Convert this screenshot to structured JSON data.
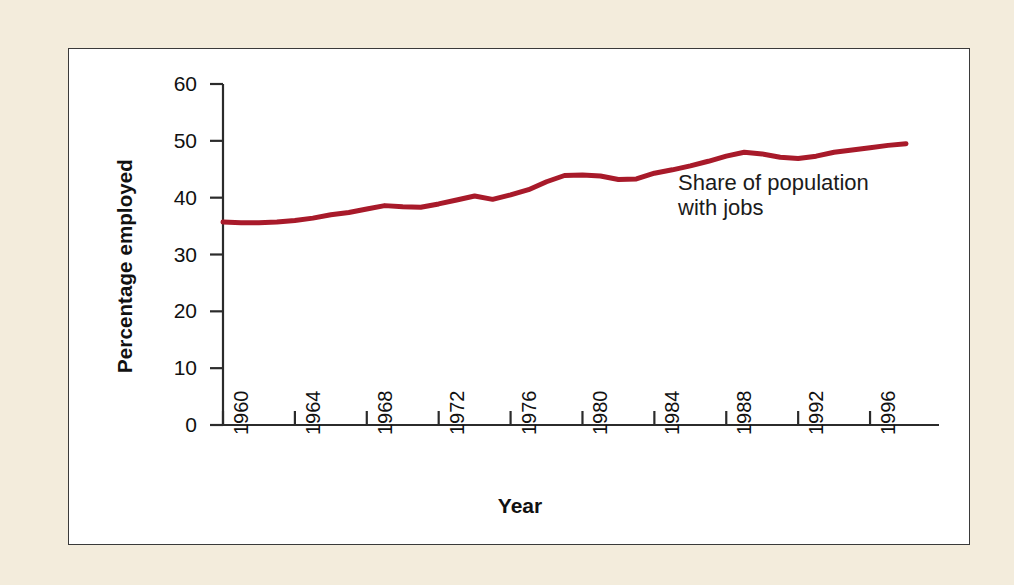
{
  "figure": {
    "background_color": "#f3ecdc",
    "plate_color": "#ffffff",
    "border_color": "#3a3a3a"
  },
  "chart_data": {
    "type": "line",
    "title": "",
    "xlabel": "Year",
    "ylabel": "Percentage employed",
    "xlim": [
      1960,
      1998
    ],
    "ylim": [
      0,
      60
    ],
    "grid": false,
    "legend_position": "inline-annotation",
    "line_color": "#a81a2a",
    "line_width": 5,
    "annotations": [
      {
        "text": "Share of population\nwith jobs",
        "x": 1985.5,
        "y": 42.0
      }
    ],
    "xticks": [
      1960,
      1964,
      1968,
      1972,
      1976,
      1980,
      1984,
      1988,
      1992,
      1996
    ],
    "xtick_labels": [
      "1960",
      "1964",
      "1968",
      "1972",
      "1976",
      "1980",
      "1984",
      "1988",
      "1992",
      "1996"
    ],
    "yticks": [
      0,
      10,
      20,
      30,
      40,
      50,
      60
    ],
    "ytick_labels": [
      "0",
      "10",
      "20",
      "30",
      "40",
      "50",
      "60"
    ],
    "series": [
      {
        "name": "Share of population with jobs",
        "x": [
          1960,
          1961,
          1962,
          1963,
          1964,
          1965,
          1966,
          1967,
          1968,
          1969,
          1970,
          1971,
          1972,
          1973,
          1974,
          1975,
          1976,
          1977,
          1978,
          1979,
          1980,
          1981,
          1982,
          1983,
          1984,
          1985,
          1986,
          1987,
          1988,
          1989,
          1990,
          1991,
          1992,
          1993,
          1994,
          1995,
          1996,
          1997,
          1998
        ],
        "values": [
          35.7,
          35.6,
          35.6,
          35.7,
          36.0,
          36.4,
          37.0,
          37.4,
          38.0,
          38.6,
          38.4,
          38.3,
          38.9,
          39.6,
          40.3,
          39.7,
          40.5,
          41.4,
          42.8,
          43.9,
          44.0,
          43.8,
          43.2,
          43.3,
          44.3,
          44.9,
          45.6,
          46.4,
          47.3,
          48.0,
          47.7,
          47.1,
          46.9,
          47.3,
          48.0,
          48.4,
          48.8,
          49.2,
          49.5
        ]
      }
    ]
  }
}
